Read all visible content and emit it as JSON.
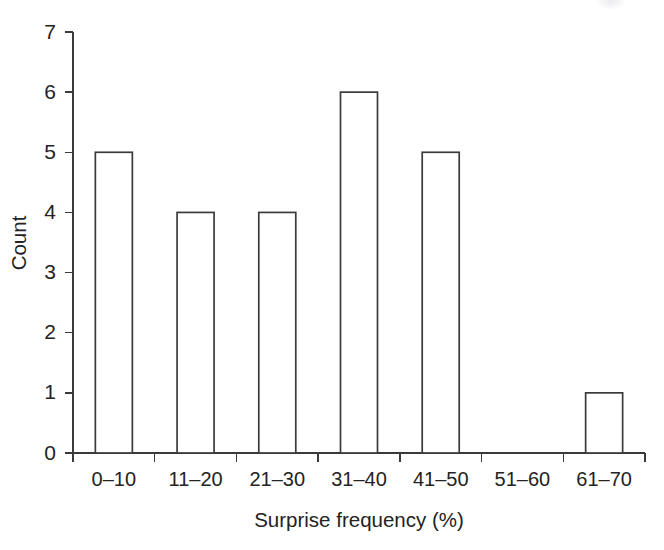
{
  "chart_data": {
    "type": "bar",
    "title": "",
    "subtitle": "",
    "xlabel": "Surprise frequency (%)",
    "ylabel": "Count",
    "categories": [
      "0–10",
      "11–20",
      "21–30",
      "31–40",
      "41–50",
      "51–60",
      "61–70"
    ],
    "values": [
      5,
      4,
      4,
      6,
      5,
      0,
      1
    ],
    "ytick_labels": [
      "0",
      "1",
      "2",
      "3",
      "4",
      "5",
      "6",
      "7"
    ],
    "yticks": [
      0,
      1,
      2,
      3,
      4,
      5,
      6,
      7
    ],
    "ylim": [
      0,
      7
    ],
    "grid": false,
    "legend": false,
    "legend_position": "none",
    "annotations": [],
    "bar_fill": "#ffffff",
    "bar_edge_color": "#3b3b3b",
    "axis_color": "#3a3a3a",
    "text_color": "#232323"
  },
  "axes": {
    "y_axis_label": "Count",
    "x_axis_label": "Surprise frequency (%)"
  }
}
